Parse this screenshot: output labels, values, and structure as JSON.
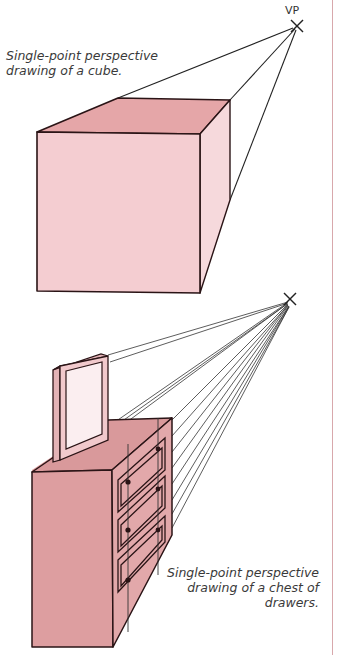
{
  "figure": {
    "vp_label": "VP",
    "captions": {
      "cube": "Single-point perspective drawing of a cube.",
      "chest": "Single-point perspective drawing of a chest of drawers."
    },
    "colors": {
      "cube_top": "#e5a6a8",
      "cube_front": "#f4cdd1",
      "cube_side": "#f6d9dc",
      "chest_top": "#d9999b",
      "chest_front": "#dd9ea0",
      "chest_side": "#e2a8aa",
      "mirror_frame": "#f1c9cc",
      "mirror_glass": "#fbeef0",
      "outline": "#2a1416",
      "guide_line": "#333333",
      "page_rule": "#d8a8ac"
    },
    "vanishing_points": [
      {
        "name": "vp-cube",
        "x": 297,
        "y": 25
      },
      {
        "name": "vp-chest",
        "x": 290,
        "y": 300
      }
    ]
  }
}
